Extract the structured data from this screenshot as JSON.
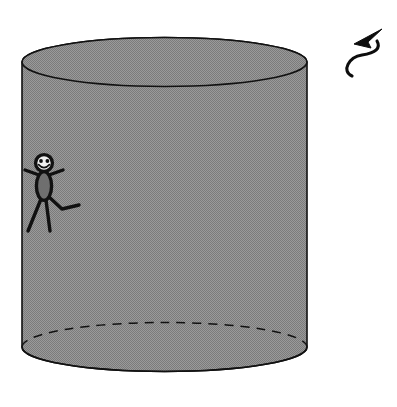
{
  "scene": {
    "title": "Cylinder with rotation arrow and running stick figure",
    "background_color": "#ffffff",
    "width": 397,
    "height": 407
  },
  "cylinder": {
    "name": "Cylinder",
    "fill_color": "#8a8a8a",
    "stroke_color": "#111111",
    "stroke_width": 1.6,
    "left_x": 22,
    "right_x": 307,
    "top_ellipse_center_y": 62,
    "bottom_ellipse_center_y": 347,
    "ellipse_rx": 142.5,
    "ellipse_ry": 24.5,
    "top_face_label": "top ellipse",
    "bottom_hidden_edge_label": "hidden back edge",
    "bottom_hidden_edge_style": "dashed",
    "bottom_hidden_edge_dash": "9 7",
    "bottom_visible_edge_style": "solid"
  },
  "rotation_arrow": {
    "name": "rotation-arrow",
    "color": "#0d0d0d",
    "direction": "counter-clockwise, pointing up-left",
    "stroke_width": 3.1,
    "path": "M 352 76 C 341 71 349 57 362 55 C 376 53 381 48 377 41",
    "head_points": "382,29 354,44 371,48 368,42",
    "bbox": {
      "x": 346,
      "y": 26,
      "width": 38,
      "height": 54
    }
  },
  "stick_figure": {
    "name": "running-stick-figure",
    "stroke_color": "#111111",
    "body_fill": "#6f6f6f",
    "face_fill": "#efefef",
    "limb_width": 3.4,
    "head": {
      "cx": 44,
      "cy": 163,
      "r": 8.4
    },
    "face": {
      "eye_left": {
        "cx": 41,
        "cy": 161,
        "r": 1.9
      },
      "eye_right": {
        "cx": 47.4,
        "cy": 161,
        "r": 1.9
      },
      "mouth_path": "M 38.6 164.6 Q 44 170.6 49.4 164.6"
    },
    "torso": {
      "cx": 44,
      "cy": 186,
      "rx": 7.6,
      "ry": 14.4
    },
    "arms": [
      {
        "name": "left-arm",
        "path": "M 39 175 L 25 170"
      },
      {
        "name": "right-arm",
        "path": "M 49 175 L 63 170"
      }
    ],
    "legs": [
      {
        "name": "left-leg",
        "path": "M 41 199 L 28 231"
      },
      {
        "name": "center-leg",
        "path": "M 46 200 L 50 231"
      },
      {
        "name": "kicking-leg",
        "path": "M 48 196 L 62 209 L 79 205"
      }
    ]
  }
}
